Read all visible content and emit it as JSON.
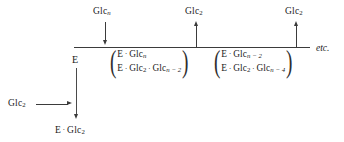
{
  "diagram": {
    "backbone": {
      "label": "reaction-backbone-line",
      "x": 74,
      "width": 236,
      "y": 47
    },
    "enzyme": {
      "label": "E"
    },
    "top_arrows": [
      {
        "name": "glc-n-input",
        "species": "Glc",
        "subscript": "n",
        "subscript_italic": true,
        "direction": "down",
        "x": 105
      },
      {
        "name": "glc2-output-first",
        "species": "Glc",
        "subscript": "2",
        "subscript_italic": false,
        "direction": "up",
        "x": 196
      },
      {
        "name": "glc2-output-second",
        "species": "Glc",
        "subscript": "2",
        "subscript_italic": false,
        "direction": "up",
        "x": 296
      }
    ],
    "complex_groups": [
      {
        "name": "complex-group-1",
        "top_row": [
          {
            "text": "E"
          },
          {
            "text": "Glc",
            "sub": "n",
            "italic": true
          }
        ],
        "bottom_row": [
          {
            "text": "E"
          },
          {
            "text": "Glc",
            "sub": "2",
            "italic": false
          },
          {
            "text": "Glc",
            "sub": "n − 2",
            "italic": true
          }
        ]
      },
      {
        "name": "complex-group-2",
        "top_row": [
          {
            "text": "E"
          },
          {
            "text": "Glc",
            "sub": "n − 2",
            "italic": true
          }
        ],
        "bottom_row": [
          {
            "text": "E"
          },
          {
            "text": "Glc",
            "sub": "2",
            "italic": false
          },
          {
            "text": "Glc",
            "sub": "n − 4",
            "italic": true
          }
        ]
      }
    ],
    "side_branch": {
      "name": "glc2-binding-branch",
      "reactant": {
        "species": "Glc",
        "subscript": "2"
      },
      "product_parts": [
        {
          "text": "E"
        },
        {
          "text": "Glc",
          "sub": "2"
        }
      ]
    },
    "continuation": "etc.",
    "colors": {
      "line": "#3b3b3b",
      "text": "#1a1a1a",
      "background": "#ffffff"
    }
  }
}
